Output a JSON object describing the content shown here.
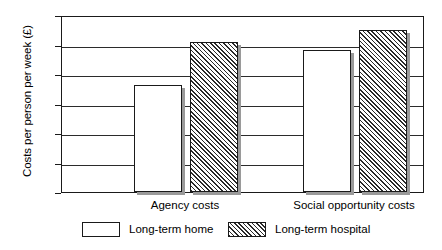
{
  "chart_data": {
    "type": "bar",
    "title": "",
    "xlabel": "",
    "ylabel": "Costs per person per week (£)",
    "ylim": [
      0,
      300
    ],
    "yticks": [
      "0",
      "50",
      "100",
      "150",
      "200",
      "250",
      "300"
    ],
    "ytick_values": [
      0,
      50,
      100,
      150,
      200,
      250,
      300
    ],
    "grid": true,
    "legend_position": "bottom",
    "categories": [
      "Agency costs",
      "Social opportunity costs"
    ],
    "series": [
      {
        "name": "Long-term home",
        "fill": "solid-white",
        "values": [
          182,
          240
        ]
      },
      {
        "name": "Long-term hospital",
        "fill": "diagonal-hatch",
        "values": [
          254,
          275
        ]
      }
    ]
  },
  "axes": {
    "y_title": "Costs per person per week (£)",
    "tick_labels": [
      "300",
      "250",
      "200",
      "150",
      "100",
      "50",
      "0"
    ]
  },
  "categories": [
    {
      "label": "Agency costs"
    },
    {
      "label": "Social opportunity costs"
    }
  ],
  "legend": {
    "items": [
      {
        "label": "Long-term home",
        "pattern": "solid"
      },
      {
        "label": "Long-term hospital",
        "pattern": "hatch"
      }
    ]
  },
  "colors": {
    "axis": "#1a1a1a",
    "grid": "#2b2b2b",
    "bar_fill": "#ffffff",
    "hatch": "#2a2a2a",
    "shadow": "#9a9a9a"
  }
}
